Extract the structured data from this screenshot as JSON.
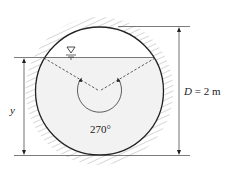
{
  "diagram": {
    "labels": {
      "diameter": "D = 2 m",
      "depth": "y",
      "angle": "270°"
    },
    "values": {
      "diameter_m": 2,
      "central_angle_deg": 270
    },
    "colors": {
      "outline": "#222222",
      "water": "#f2f2f2",
      "hatch": "#b0b0b0"
    }
  }
}
